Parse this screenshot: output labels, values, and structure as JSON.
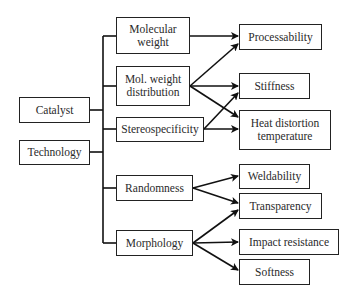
{
  "diagram": {
    "sources": [
      {
        "id": "catalyst",
        "label": "Catalyst"
      },
      {
        "id": "technology",
        "label": "Technology"
      }
    ],
    "factors": [
      {
        "id": "molecular-weight",
        "label": "Molecular weight"
      },
      {
        "id": "mol-weight-distribution",
        "label": "Mol. weight distribution"
      },
      {
        "id": "stereospecificity",
        "label": "Stereospecificity"
      },
      {
        "id": "randomness",
        "label": "Randomness"
      },
      {
        "id": "morphology",
        "label": "Morphology"
      }
    ],
    "properties": [
      {
        "id": "processability",
        "label": "Processability"
      },
      {
        "id": "stiffness",
        "label": "Stiffness"
      },
      {
        "id": "heat-distortion-temperature",
        "label": "Heat distortion temperature"
      },
      {
        "id": "weldability",
        "label": "Weldability"
      },
      {
        "id": "transparency",
        "label": "Transparency"
      },
      {
        "id": "impact-resistance",
        "label": "Impact resistance"
      },
      {
        "id": "softness",
        "label": "Softness"
      }
    ],
    "edges": [
      [
        "molecular-weight",
        "processability"
      ],
      [
        "mol-weight-distribution",
        "processability"
      ],
      [
        "mol-weight-distribution",
        "stiffness"
      ],
      [
        "mol-weight-distribution",
        "heat-distortion-temperature"
      ],
      [
        "stereospecificity",
        "stiffness"
      ],
      [
        "stereospecificity",
        "heat-distortion-temperature"
      ],
      [
        "randomness",
        "weldability"
      ],
      [
        "randomness",
        "transparency"
      ],
      [
        "morphology",
        "transparency"
      ],
      [
        "morphology",
        "impact-resistance"
      ],
      [
        "morphology",
        "softness"
      ]
    ]
  }
}
